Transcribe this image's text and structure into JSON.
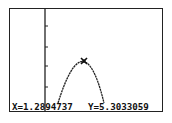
{
  "screen": {
    "type": "graphing-calculator-trace",
    "colors": {
      "background": "#ffffff",
      "foreground": "#222222"
    }
  },
  "graph": {
    "function_shape": "downward parabola",
    "y_axis_ticks": 4,
    "trace_cursor": {
      "icon": "x-cross-cursor-icon",
      "x": "1.2894737",
      "y": "5.3033059"
    }
  },
  "readout": {
    "x_label": "X=1.2894737",
    "y_label": "Y=5.3033059"
  }
}
